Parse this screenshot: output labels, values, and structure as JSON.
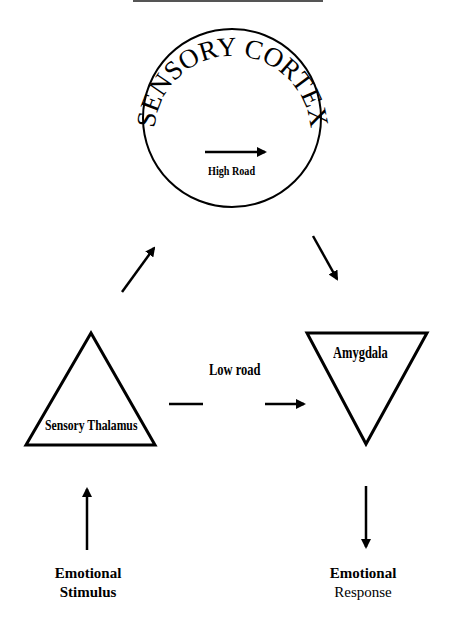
{
  "diagram": {
    "nodes": {
      "sensory_cortex": {
        "label": "SENSORY CORTEX",
        "shape": "circle"
      },
      "sensory_thalamus": {
        "label": "Sensory Thalamus",
        "shape": "triangle-up"
      },
      "amygdala": {
        "label": "Amygdala",
        "shape": "triangle-down"
      },
      "emotional_stimulus": {
        "line1": "Emotional",
        "line2": "Stimulus"
      },
      "emotional_response": {
        "line1": "Emotional",
        "line2": "Response"
      }
    },
    "edges": {
      "high_road": {
        "label": "High Road"
      },
      "low_road": {
        "label": "Low road"
      }
    },
    "colors": {
      "stroke": "#000000",
      "background": "#ffffff"
    }
  }
}
